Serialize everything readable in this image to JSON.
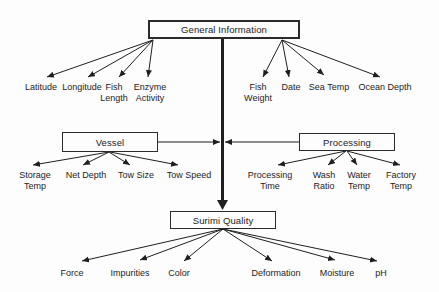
{
  "diagram_type": "hierarchy-diagram",
  "colors": {
    "background": "#fdfdfd",
    "line": "#1f1f1f",
    "box_border": "#2b2b2b",
    "text": "#1c1c1c"
  },
  "nodes": {
    "general": "General Information",
    "vessel": "Vessel",
    "processing": "Processing",
    "surimi": "Surimi Quality"
  },
  "general_left": [
    "Latitude",
    "Longitude",
    "Fish Length",
    "Enzyme Activity"
  ],
  "general_right": [
    "Fish Weight",
    "Date",
    "Sea Temp",
    "Ocean Depth"
  ],
  "vessel_items": [
    "Storage Temp",
    "Net Depth",
    "Tow Size",
    "Tow Speed"
  ],
  "processing_items": [
    "Processing Time",
    "Wash Ratio",
    "Water Temp",
    "Factory Temp"
  ],
  "surimi_items": [
    "Force",
    "Impurities",
    "Color",
    "Deformation",
    "Moisture",
    "pH"
  ]
}
